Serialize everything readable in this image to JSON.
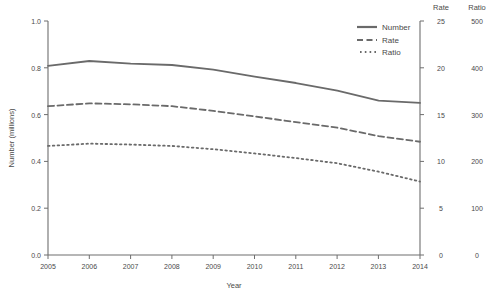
{
  "chart_data": {
    "type": "line",
    "title": "",
    "xlabel": "Year",
    "ylabel": "Number (millions)",
    "grid": false,
    "legend_position": "top-right",
    "x": [
      2005,
      2006,
      2007,
      2008,
      2009,
      2010,
      2011,
      2012,
      2013,
      2014
    ],
    "categories": [
      "2005",
      "2006",
      "2007",
      "2008",
      "2009",
      "2010",
      "2011",
      "2012",
      "2013",
      "2014"
    ],
    "axes": {
      "left": {
        "label": "Number (millions)",
        "ticks": [
          "0.0",
          "0.2",
          "0.4",
          "0.6",
          "0.8",
          "1.0"
        ],
        "tick_values": [
          0.0,
          0.2,
          0.4,
          0.6,
          0.8,
          1.0
        ],
        "lim": [
          0.0,
          1.0
        ]
      },
      "right_rate": {
        "label": "Rate",
        "ticks": [
          "0",
          "5",
          "10",
          "15",
          "20",
          "25"
        ],
        "tick_values": [
          0,
          5,
          10,
          15,
          20,
          25
        ],
        "lim": [
          0,
          25
        ]
      },
      "right_ratio": {
        "label": "Ratio",
        "ticks": [
          "0",
          "100",
          "200",
          "300",
          "400",
          "500"
        ],
        "tick_values": [
          0,
          100,
          200,
          300,
          400,
          500
        ],
        "lim": [
          0,
          500
        ]
      },
      "bottom": {
        "label": "Year",
        "ticks": [
          "2005",
          "2006",
          "2007",
          "2008",
          "2009",
          "2010",
          "2011",
          "2012",
          "2013",
          "2014"
        ],
        "lim": [
          2005,
          2014
        ]
      }
    },
    "series": [
      {
        "name": "Number",
        "axis": "left",
        "style": "solid",
        "color": "#6a6a6a",
        "values": [
          0.808,
          0.829,
          0.818,
          0.812,
          0.792,
          0.762,
          0.735,
          0.702,
          0.66,
          0.65
        ]
      },
      {
        "name": "Rate",
        "axis": "right_rate",
        "style": "dashed",
        "color": "#6a6a6a",
        "values": [
          15.9,
          16.2,
          16.1,
          15.9,
          15.4,
          14.8,
          14.2,
          13.6,
          12.7,
          12.1
        ]
      },
      {
        "name": "Ratio",
        "axis": "right_ratio",
        "style": "dotted",
        "color": "#6a6a6a",
        "values": [
          233,
          238,
          236,
          233,
          226,
          217,
          207,
          196,
          178,
          157
        ]
      }
    ],
    "legend": [
      {
        "label": "Number",
        "style": "solid"
      },
      {
        "label": "Rate",
        "style": "dashed"
      },
      {
        "label": "Ratio",
        "style": "dotted"
      }
    ]
  }
}
